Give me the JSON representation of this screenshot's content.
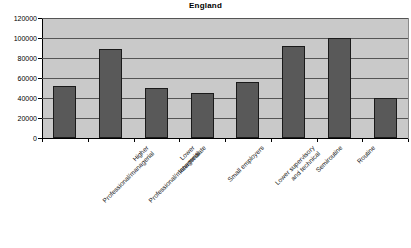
{
  "chart_data": {
    "type": "bar",
    "title": "England",
    "xlabel": "",
    "ylabel": "",
    "ylim": [
      0,
      120000
    ],
    "ytick_step": 20000,
    "yticks": [
      "0",
      "20000",
      "40000",
      "60000",
      "80000",
      "100000",
      "120000"
    ],
    "ytick_values": [
      0,
      20000,
      40000,
      60000,
      80000,
      100000,
      120000
    ],
    "grid": true,
    "legend": "none",
    "bar_color": "#595959",
    "plot_background": "#c9c9c9",
    "categories": [
      "Higher Professional/managerial",
      "Lower Professional/managerial",
      "Intermediate",
      "Small employers",
      "Lower supervisory and technical",
      "Semiroutine",
      "Routine",
      "Never worked or long term unemployed"
    ],
    "category_lines": [
      [
        "Higher",
        "Professional/managerial"
      ],
      [
        "Lower",
        "Professional/managerial"
      ],
      [
        "Intermediate"
      ],
      [
        "Small employers"
      ],
      [
        "Lower supervisory",
        "and technical"
      ],
      [
        "Semiroutine"
      ],
      [
        "Routine"
      ],
      [
        "Never worked or long",
        "term unemployed"
      ]
    ],
    "values": [
      52000,
      89000,
      50000,
      45000,
      56000,
      92500,
      100000,
      40000
    ]
  },
  "footer": {
    "note": ""
  }
}
